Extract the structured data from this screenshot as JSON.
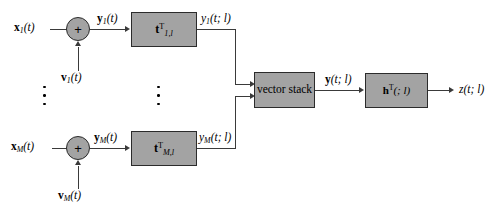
{
  "diagram": {
    "colors": {
      "block_fill": "#a3a3a3",
      "block_border": "#2b2b2b",
      "line": "#3a3a3a",
      "background": "#ffffff",
      "text": "#000000"
    },
    "branches": [
      {
        "id": "branch-1",
        "input_signal": "x",
        "input_signal_sub": "1",
        "input_signal_arg": "(t)",
        "noise_signal": "v",
        "noise_signal_sub": "1",
        "noise_signal_arg": "(t)",
        "sum_output": "y",
        "sum_output_sub": "1",
        "sum_output_arg": "(t)",
        "filter_symbol": "t",
        "filter_sup": "T",
        "filter_sub": "1,l",
        "filter_output": "y",
        "filter_output_sub": "1",
        "filter_output_arg": "(t; l)"
      },
      {
        "id": "branch-M",
        "input_signal": "x",
        "input_signal_sub": "M",
        "input_signal_arg": "(t)",
        "noise_signal": "v",
        "noise_signal_sub": "M",
        "noise_signal_arg": "(t)",
        "sum_output": "y",
        "sum_output_sub": "M",
        "sum_output_arg": "(t)",
        "filter_symbol": "t",
        "filter_sup": "T",
        "filter_sub": "M,l",
        "filter_output": "y",
        "filter_output_sub": "M",
        "filter_output_arg": "(t; l)"
      }
    ],
    "junction": {
      "operator": "+"
    },
    "vector_stack": {
      "label": "vector stack",
      "output_symbol": "y",
      "output_arg": "(t; l)"
    },
    "output_filter": {
      "symbol": "h",
      "sup": "T",
      "arg": "(; l)"
    },
    "final_output": {
      "symbol": "z",
      "arg": "(t; l)"
    },
    "ellipsis": {
      "dots": 3
    }
  }
}
